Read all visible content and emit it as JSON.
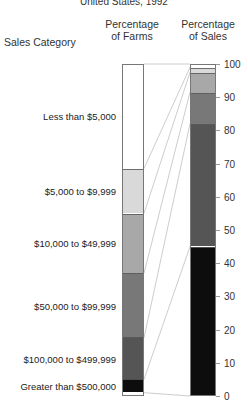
{
  "chart_data": {
    "type": "bar",
    "title": "United States, 1992",
    "subtitle": "",
    "xlabel": "",
    "ylabel": "",
    "ylim": [
      0,
      100
    ],
    "grid": false,
    "legend_position": "none",
    "category_axis_label": "Sales Category",
    "categories": [
      "Less than $5,000",
      "$5,000 to $9,999",
      "$10,000 to $49,999",
      "$50,000 to $99,999",
      "$100,000 to $499,999",
      "Greater than $500,000"
    ],
    "series": [
      {
        "name": "Percentage of Farms",
        "values": [
          31.5,
          13.5,
          18.0,
          19.5,
          12.5,
          4.0
        ]
      },
      {
        "name": "Percentage of Sales",
        "values": [
          1.0,
          1.5,
          6.0,
          9.5,
          37.0,
          45.0
        ]
      }
    ],
    "segment_colors": [
      "#ffffff",
      "#d9d9d9",
      "#a8a8a8",
      "#787878",
      "#555555",
      "#0d0d0d"
    ],
    "tick_labels": [
      "0",
      "10",
      "20",
      "30",
      "40",
      "50",
      "60",
      "70",
      "80",
      "90",
      "100"
    ],
    "tick_values": [
      0,
      10,
      20,
      30,
      40,
      50,
      60,
      70,
      80,
      90,
      100
    ]
  },
  "header": {
    "category_label": "Sales Category",
    "farms_label_line1": "Percentage",
    "farms_label_line2": "of Farms",
    "sales_label_line1": "Percentage",
    "sales_label_line2": "of Sales"
  },
  "colors": {
    "background": "#ffffff",
    "text": "#222222",
    "bar_outline": "#777777",
    "connector": "#bfbfbf"
  }
}
